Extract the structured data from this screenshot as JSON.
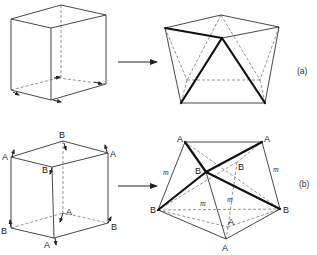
{
  "figure": {
    "panels": [
      {
        "id": "a",
        "tag": "(a)",
        "description": "Cube transformed into polyhedron with three thick edges meeting at top vertex"
      },
      {
        "id": "b",
        "tag": "(b)",
        "description": "Cube with labeled A/B vertices transformed into polyhedron with labeled A/B vertices and mirror planes m",
        "cube_labels": [
          "A",
          "B",
          "A",
          "B",
          "A",
          "B",
          "B",
          "A"
        ],
        "polyhedron_labels": [
          "A",
          "A",
          "B",
          "B",
          "B",
          "B",
          "A",
          "A"
        ],
        "mirror_label": "m"
      }
    ],
    "labels": {
      "A": "A",
      "B": "B",
      "m": "m",
      "tag_a": "(a)",
      "tag_b": "(b)"
    }
  }
}
